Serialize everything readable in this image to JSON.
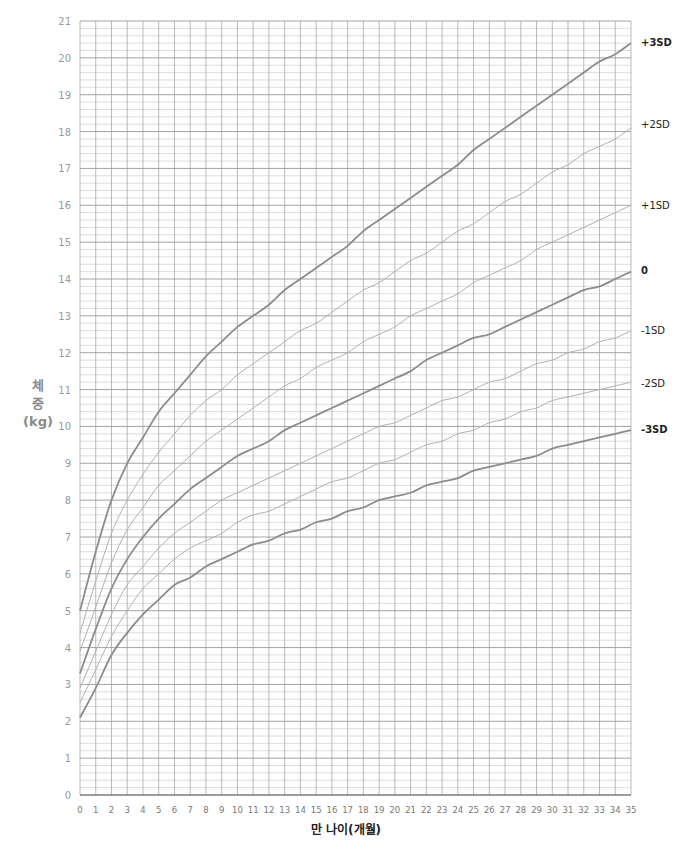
{
  "chart_data": {
    "type": "line",
    "title": "",
    "xlabel": "만 나이(개월)",
    "ylabel": [
      "체",
      "중",
      "(kg)"
    ],
    "xlim": [
      0,
      35
    ],
    "ylim": [
      0,
      21
    ],
    "grid": true,
    "x_ticks": [
      0,
      1,
      2,
      3,
      4,
      5,
      6,
      7,
      8,
      9,
      10,
      11,
      12,
      13,
      14,
      15,
      16,
      17,
      18,
      19,
      20,
      21,
      22,
      23,
      24,
      25,
      26,
      27,
      28,
      29,
      30,
      31,
      32,
      33,
      34,
      35
    ],
    "y_ticks": [
      0,
      1,
      2,
      3,
      4,
      5,
      6,
      7,
      8,
      9,
      10,
      11,
      12,
      13,
      14,
      15,
      16,
      17,
      18,
      19,
      20,
      21
    ],
    "x": [
      0,
      1,
      2,
      3,
      4,
      5,
      6,
      7,
      8,
      9,
      10,
      11,
      12,
      13,
      14,
      15,
      16,
      17,
      18,
      19,
      20,
      21,
      22,
      23,
      24,
      25,
      26,
      27,
      28,
      29,
      30,
      31,
      32,
      33,
      34,
      35
    ],
    "series": [
      {
        "name": "+3SD",
        "weight": "bold",
        "values": [
          5.0,
          6.6,
          8.0,
          9.0,
          9.7,
          10.4,
          10.9,
          11.4,
          11.9,
          12.3,
          12.7,
          13.0,
          13.3,
          13.7,
          14.0,
          14.3,
          14.6,
          14.9,
          15.3,
          15.6,
          15.9,
          16.2,
          16.5,
          16.8,
          17.1,
          17.5,
          17.8,
          18.1,
          18.4,
          18.7,
          19.0,
          19.3,
          19.6,
          19.9,
          20.1,
          20.4
        ]
      },
      {
        "name": "+2SD",
        "weight": "light",
        "values": [
          4.4,
          5.8,
          7.1,
          8.0,
          8.7,
          9.3,
          9.8,
          10.3,
          10.7,
          11.0,
          11.4,
          11.7,
          12.0,
          12.3,
          12.6,
          12.8,
          13.1,
          13.4,
          13.7,
          13.9,
          14.2,
          14.5,
          14.7,
          15.0,
          15.3,
          15.5,
          15.8,
          16.1,
          16.3,
          16.6,
          16.9,
          17.1,
          17.4,
          17.6,
          17.8,
          18.1
        ]
      },
      {
        "name": "+1SD",
        "weight": "light",
        "values": [
          3.9,
          5.1,
          6.3,
          7.2,
          7.8,
          8.4,
          8.8,
          9.2,
          9.6,
          9.9,
          10.2,
          10.5,
          10.8,
          11.1,
          11.3,
          11.6,
          11.8,
          12.0,
          12.3,
          12.5,
          12.7,
          13.0,
          13.2,
          13.4,
          13.6,
          13.9,
          14.1,
          14.3,
          14.5,
          14.8,
          15.0,
          15.2,
          15.4,
          15.6,
          15.8,
          16.0
        ]
      },
      {
        "name": "0",
        "weight": "bold",
        "values": [
          3.3,
          4.5,
          5.6,
          6.4,
          7.0,
          7.5,
          7.9,
          8.3,
          8.6,
          8.9,
          9.2,
          9.4,
          9.6,
          9.9,
          10.1,
          10.3,
          10.5,
          10.7,
          10.9,
          11.1,
          11.3,
          11.5,
          11.8,
          12.0,
          12.2,
          12.4,
          12.5,
          12.7,
          12.9,
          13.1,
          13.3,
          13.5,
          13.7,
          13.8,
          14.0,
          14.2
        ]
      },
      {
        "name": "-1SD",
        "weight": "light",
        "values": [
          2.9,
          3.9,
          4.9,
          5.7,
          6.2,
          6.7,
          7.1,
          7.4,
          7.7,
          8.0,
          8.2,
          8.4,
          8.6,
          8.8,
          9.0,
          9.2,
          9.4,
          9.6,
          9.8,
          10.0,
          10.1,
          10.3,
          10.5,
          10.7,
          10.8,
          11.0,
          11.2,
          11.3,
          11.5,
          11.7,
          11.8,
          12.0,
          12.1,
          12.3,
          12.4,
          12.6
        ]
      },
      {
        "name": "-2SD",
        "weight": "light",
        "values": [
          2.5,
          3.4,
          4.3,
          5.0,
          5.6,
          6.0,
          6.4,
          6.7,
          6.9,
          7.1,
          7.4,
          7.6,
          7.7,
          7.9,
          8.1,
          8.3,
          8.5,
          8.6,
          8.8,
          9.0,
          9.1,
          9.3,
          9.5,
          9.6,
          9.8,
          9.9,
          10.1,
          10.2,
          10.4,
          10.5,
          10.7,
          10.8,
          10.9,
          11.0,
          11.1,
          11.2
        ]
      },
      {
        "name": "-3SD",
        "weight": "bold",
        "values": [
          2.1,
          2.9,
          3.8,
          4.4,
          4.9,
          5.3,
          5.7,
          5.9,
          6.2,
          6.4,
          6.6,
          6.8,
          6.9,
          7.1,
          7.2,
          7.4,
          7.5,
          7.7,
          7.8,
          8.0,
          8.1,
          8.2,
          8.4,
          8.5,
          8.6,
          8.8,
          8.9,
          9.0,
          9.1,
          9.2,
          9.4,
          9.5,
          9.6,
          9.7,
          9.8,
          9.9
        ]
      }
    ],
    "legend": "right-end labels",
    "colors": {
      "bold_curve": "#8c8c8c",
      "light_curve": "#b0b0b0",
      "grid_major": "#9a9a9a",
      "grid_minor": "#d4d4d4",
      "grid_vertical": "#a8a8a8"
    }
  }
}
